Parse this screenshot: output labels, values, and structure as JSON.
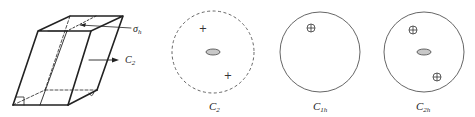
{
  "prism": {
    "mirror_label": "σ",
    "mirror_sub": "h",
    "axis_label": "C",
    "axis_sub": "2"
  },
  "projections": [
    {
      "id": "C2",
      "label": "C",
      "sub": "2",
      "border": "dashed",
      "symbols": [
        "+",
        "+"
      ],
      "center_ellipse": true
    },
    {
      "id": "C1h",
      "label": "C",
      "sub": "1h",
      "border": "solid",
      "symbols": [
        "⊕"
      ],
      "center_ellipse": false
    },
    {
      "id": "C2h",
      "label": "C",
      "sub": "2h",
      "border": "solid",
      "symbols": [
        "⊕",
        "⊕"
      ],
      "center_ellipse": true
    }
  ],
  "colors": {
    "line": "#222222",
    "ellipse_fill": "#c8c8c8",
    "circle": "#555555"
  }
}
